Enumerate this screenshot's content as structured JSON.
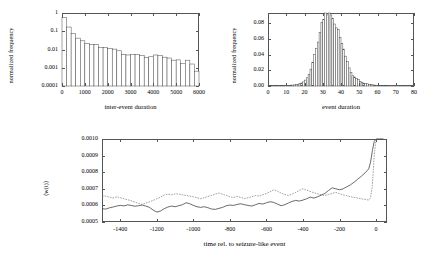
{
  "figure": {
    "background": "#ffffff",
    "line_color": "#3a3a3a",
    "dotted_color": "#777777",
    "bar_edge_color": "#4a4a4a"
  },
  "chart_data": [
    {
      "type": "bar",
      "id": "inter-event-duration-histogram",
      "title": "",
      "xlabel": "inter-event duration",
      "ylabel": "normalized frequency",
      "yscale": "log",
      "xlim": [
        0,
        6000
      ],
      "ylim": [
        0.0001,
        1
      ],
      "grid": false,
      "legend": "none",
      "xticks": [
        0,
        1000,
        2000,
        3000,
        4000,
        5000,
        6000
      ],
      "xtick_labels": [
        "0",
        "1000",
        "2000",
        "3000",
        "4000",
        "5000",
        "6000"
      ],
      "yticks": [
        1,
        0.1,
        0.01,
        0.001,
        0.0001
      ],
      "ytick_labels": [
        "1",
        "0.1",
        "0.01",
        "0.001",
        "0.0001"
      ],
      "bin_width": 200,
      "bin_edges": [
        0,
        200,
        400,
        600,
        800,
        1000,
        1200,
        1400,
        1600,
        1800,
        2000,
        2200,
        2400,
        2600,
        2800,
        3000,
        3200,
        3400,
        3600,
        3800,
        4000,
        4200,
        4400,
        4600,
        4800,
        5000,
        5200,
        5400,
        5600,
        5800,
        6000
      ],
      "values": [
        0.55,
        0.17,
        0.075,
        0.042,
        0.03,
        0.021,
        0.019,
        0.019,
        0.013,
        0.0125,
        0.0115,
        0.0105,
        0.0085,
        0.0052,
        0.005,
        0.0052,
        0.0053,
        0.0048,
        0.0037,
        0.004,
        0.005,
        0.0048,
        0.0038,
        0.0034,
        0.0026,
        0.0027,
        0.0017,
        0.0026,
        0.0016,
        0.00065
      ]
    },
    {
      "type": "bar",
      "id": "event-duration-histogram",
      "title": "",
      "xlabel": "event duration",
      "ylabel": "normalized frequency",
      "yscale": "linear",
      "xlim": [
        0,
        80
      ],
      "ylim": [
        0,
        0.093
      ],
      "grid": false,
      "legend": "none",
      "xticks": [
        0,
        10,
        20,
        30,
        40,
        50,
        60,
        70,
        80
      ],
      "xtick_labels": [
        "0",
        "10",
        "20",
        "30",
        "40",
        "50",
        "60",
        "70",
        "80"
      ],
      "yticks": [
        0.0,
        0.02,
        0.04,
        0.06,
        0.08
      ],
      "ytick_labels": [
        "0.00",
        "0.02",
        "0.04",
        "0.06",
        "0.08"
      ],
      "bin_width": 1,
      "x": [
        1,
        2,
        3,
        4,
        5,
        6,
        7,
        8,
        9,
        10,
        11,
        12,
        13,
        14,
        15,
        16,
        17,
        18,
        19,
        20,
        21,
        22,
        23,
        24,
        25,
        26,
        27,
        28,
        29,
        30,
        31,
        32,
        33,
        34,
        35,
        36,
        37,
        38,
        39,
        40,
        41,
        42,
        43,
        44,
        45,
        46,
        47,
        48,
        49,
        50,
        51,
        52,
        53,
        54,
        55,
        56,
        57,
        58,
        59,
        60,
        61,
        62,
        63,
        64,
        65,
        66,
        67,
        68,
        69,
        70,
        71,
        72,
        73,
        74,
        75,
        76,
        77,
        78,
        79,
        80
      ],
      "values": [
        0.0003,
        0.0005,
        0.0006,
        0.0004,
        0.0004,
        0.0005,
        0.0006,
        0.0005,
        0.0006,
        0.0008,
        0.0008,
        0.0009,
        0.0011,
        0.0012,
        0.0013,
        0.0018,
        0.0022,
        0.003,
        0.0038,
        0.0052,
        0.0075,
        0.0105,
        0.015,
        0.0215,
        0.03,
        0.04,
        0.048,
        0.056,
        0.068,
        0.081,
        0.0845,
        0.093,
        0.0905,
        0.093,
        0.0905,
        0.086,
        0.079,
        0.074,
        0.072,
        0.062,
        0.054,
        0.047,
        0.038,
        0.031,
        0.023,
        0.0175,
        0.013,
        0.0115,
        0.0095,
        0.008,
        0.0055,
        0.0042,
        0.0036,
        0.003,
        0.0028,
        0.002,
        0.0016,
        0.0014,
        0.0011,
        0.001,
        0.0008,
        0.0006,
        0.0005,
        0.0005,
        0.0004,
        0.0004,
        0.0003,
        0.0003,
        0.0002,
        0.0002,
        0.0002,
        0.0002,
        0.0001,
        0.0001,
        0.0001,
        0.0001,
        0.0001,
        0.0001,
        0.0001,
        0.0001
      ]
    },
    {
      "type": "line",
      "id": "mean-weight-vs-time",
      "title": "",
      "xlabel": "time rel. to seizure-like event",
      "ylabel": "⟨w(t)⟩",
      "xlim": [
        -1500,
        60
      ],
      "ylim": [
        0.0005,
        0.001
      ],
      "grid": false,
      "legend": "none",
      "xticks": [
        -1400,
        -1200,
        -1000,
        -800,
        -600,
        -400,
        -200,
        0
      ],
      "xtick_labels": [
        "-1400",
        "-1200",
        "-1000",
        "-800",
        "-600",
        "-400",
        "-200",
        "0"
      ],
      "yticks": [
        0.0005,
        0.0006,
        0.0007,
        0.0008,
        0.0009,
        0.001
      ],
      "ytick_labels": [
        "0.0005",
        "0.0006",
        "0.0007",
        "0.0008",
        "0.0009",
        "0.0010"
      ],
      "series": [
        {
          "name": "solid",
          "style": "solid",
          "x": [
            -1500,
            -1480,
            -1460,
            -1440,
            -1420,
            -1400,
            -1380,
            -1360,
            -1340,
            -1320,
            -1300,
            -1280,
            -1260,
            -1240,
            -1220,
            -1200,
            -1180,
            -1160,
            -1140,
            -1120,
            -1100,
            -1080,
            -1060,
            -1040,
            -1020,
            -1000,
            -980,
            -960,
            -940,
            -920,
            -900,
            -880,
            -860,
            -840,
            -820,
            -800,
            -780,
            -760,
            -740,
            -720,
            -700,
            -680,
            -660,
            -640,
            -620,
            -600,
            -580,
            -560,
            -540,
            -520,
            -500,
            -480,
            -460,
            -440,
            -420,
            -400,
            -380,
            -360,
            -340,
            -320,
            -300,
            -280,
            -260,
            -240,
            -220,
            -200,
            -180,
            -160,
            -140,
            -120,
            -100,
            -80,
            -60,
            -40,
            -30,
            -20,
            -10,
            0,
            20,
            40
          ],
          "values": [
            0.00058,
            0.000578,
            0.000585,
            0.00059,
            0.000596,
            0.0006,
            0.000597,
            0.000603,
            0.0006,
            0.000595,
            0.000598,
            0.000602,
            0.000596,
            0.000588,
            0.000572,
            0.00056,
            0.000566,
            0.00058,
            0.00059,
            0.000596,
            0.000592,
            0.000598,
            0.000604,
            0.000616,
            0.00061,
            0.0006,
            0.000592,
            0.000588,
            0.000592,
            0.000586,
            0.000578,
            0.000576,
            0.000582,
            0.000588,
            0.000598,
            0.000602,
            0.0006,
            0.000606,
            0.00061,
            0.000604,
            0.0006,
            0.000596,
            0.000604,
            0.000612,
            0.000608,
            0.000616,
            0.000622,
            0.000618,
            0.000608,
            0.000598,
            0.000604,
            0.000614,
            0.000624,
            0.00063,
            0.000626,
            0.000632,
            0.00064,
            0.00065,
            0.000644,
            0.000652,
            0.000662,
            0.000672,
            0.00069,
            0.000706,
            0.0007,
            0.000694,
            0.0007,
            0.000712,
            0.000724,
            0.00074,
            0.000758,
            0.000776,
            0.000796,
            0.00082,
            0.00086,
            0.00093,
            0.000985,
            0.001,
            0.001,
            0.001
          ]
        },
        {
          "name": "dotted",
          "style": "dotted",
          "x": [
            -1500,
            -1480,
            -1460,
            -1440,
            -1420,
            -1400,
            -1380,
            -1360,
            -1340,
            -1320,
            -1300,
            -1280,
            -1260,
            -1240,
            -1220,
            -1200,
            -1180,
            -1160,
            -1140,
            -1120,
            -1100,
            -1080,
            -1060,
            -1040,
            -1020,
            -1000,
            -980,
            -960,
            -940,
            -920,
            -900,
            -880,
            -860,
            -840,
            -820,
            -800,
            -780,
            -760,
            -740,
            -720,
            -700,
            -680,
            -660,
            -640,
            -620,
            -600,
            -580,
            -560,
            -540,
            -520,
            -500,
            -480,
            -460,
            -440,
            -420,
            -400,
            -380,
            -360,
            -340,
            -320,
            -300,
            -280,
            -260,
            -240,
            -220,
            -200,
            -180,
            -160,
            -140,
            -120,
            -100,
            -80,
            -60,
            -40,
            -30,
            -20,
            -10,
            0,
            20,
            40
          ],
          "values": [
            0.00066,
            0.000656,
            0.00065,
            0.000644,
            0.000652,
            0.000646,
            0.00064,
            0.000634,
            0.000628,
            0.00062,
            0.000612,
            0.000606,
            0.000614,
            0.000622,
            0.00063,
            0.00064,
            0.00065,
            0.000662,
            0.000668,
            0.000664,
            0.00067,
            0.000668,
            0.000664,
            0.00066,
            0.000656,
            0.000652,
            0.000646,
            0.00064,
            0.000646,
            0.000654,
            0.00066,
            0.000668,
            0.000674,
            0.000668,
            0.00066,
            0.000652,
            0.000648,
            0.000654,
            0.000648,
            0.000642,
            0.000646,
            0.000652,
            0.00066,
            0.000656,
            0.000664,
            0.000672,
            0.000682,
            0.000694,
            0.000686,
            0.000674,
            0.000666,
            0.00066,
            0.000668,
            0.000678,
            0.00069,
            0.0007,
            0.000692,
            0.000684,
            0.000676,
            0.00067,
            0.000664,
            0.00066,
            0.000666,
            0.000672,
            0.000678,
            0.00067,
            0.000664,
            0.000658,
            0.000652,
            0.000648,
            0.000644,
            0.00064,
            0.000636,
            0.000632,
            0.000646,
            0.00072,
            0.0009,
            0.001,
            0.001,
            0.001
          ]
        }
      ]
    }
  ]
}
